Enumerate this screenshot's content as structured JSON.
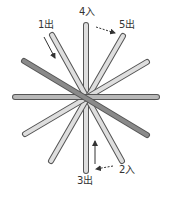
{
  "diagram": {
    "center": [
      86,
      97
    ],
    "colors": {
      "light_stick_fill": "#dedede",
      "dark_stick_fill": "#8a8a8a",
      "horizontal_stick_fill": "#b8b8b8",
      "stick_outline": "#555555",
      "arrow": "#333333",
      "label": "#333333"
    },
    "sticks": [
      {
        "name": "vertical",
        "x1": 86,
        "y1": 25,
        "x2": 86,
        "y2": 171,
        "tone": "light"
      },
      {
        "name": "left-top-to-right-bottom-steep",
        "x1": 52,
        "y1": 35,
        "x2": 122,
        "y2": 161,
        "tone": "light"
      },
      {
        "name": "right-top-to-left-bottom-steep",
        "x1": 123,
        "y1": 36,
        "x2": 51,
        "y2": 161,
        "tone": "light"
      },
      {
        "name": "right-shallow",
        "x1": 147,
        "y1": 62,
        "x2": 25,
        "y2": 134,
        "tone": "light"
      },
      {
        "name": "horizontal",
        "x1": 15,
        "y1": 97,
        "x2": 157,
        "y2": 97,
        "tone": "medium"
      },
      {
        "name": "dark-diagonal",
        "x1": 24,
        "y1": 61,
        "x2": 147,
        "y2": 135,
        "tone": "dark"
      }
    ],
    "labels": [
      {
        "id": "label-1",
        "text": "1出",
        "x": 38,
        "y": 20
      },
      {
        "id": "label-4",
        "text": "4入",
        "x": 79,
        "y": 7
      },
      {
        "id": "label-5",
        "text": "5出",
        "x": 119,
        "y": 20
      },
      {
        "id": "label-2",
        "text": "2入",
        "x": 119,
        "y": 165
      },
      {
        "id": "label-3",
        "text": "3出",
        "x": 77,
        "y": 176
      }
    ],
    "arrows": [
      {
        "name": "arrow-1",
        "x1": 44,
        "y1": 37,
        "x2": 55,
        "y2": 58,
        "dashed": false
      },
      {
        "name": "arrow-4-to-5",
        "x1": 96,
        "y1": 27,
        "x2": 115,
        "y2": 33,
        "dashed": true
      },
      {
        "name": "arrow-up",
        "x1": 95,
        "y1": 164,
        "x2": 95,
        "y2": 141,
        "dashed": false
      },
      {
        "name": "arrow-2-to-3",
        "x1": 113,
        "y1": 166,
        "x2": 96,
        "y2": 169,
        "dashed": true
      }
    ]
  }
}
